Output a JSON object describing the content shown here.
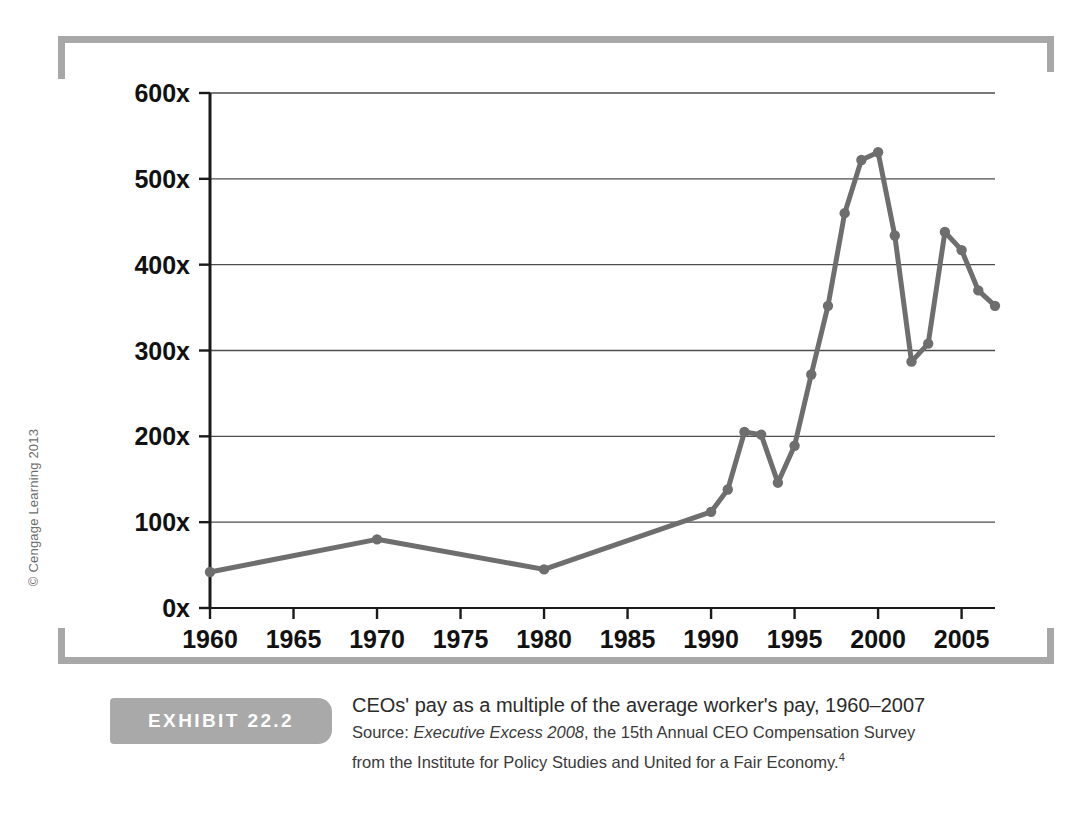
{
  "exhibit": {
    "tab_label": "EXHIBIT 22.2",
    "title": "CEOs' pay as a multiple of the average worker's pay, 1960–2007",
    "source_prefix": "Source: ",
    "source_italic": "Executive Excess 2008",
    "source_rest": ", the 15th Annual CEO Compensation Survey",
    "source_line2": "from the Institute for Policy Studies and United for a Fair Economy.",
    "footnote_marker": "4"
  },
  "copyright": "© Cengage Learning 2013",
  "colors": {
    "line": "#6e6e6e",
    "marker": "#6e6e6e",
    "axis": "#1a1a1a",
    "grid": "#4d4d4d",
    "bracket": "#a8a8a8",
    "tab": "#a9a9a9"
  },
  "chart_data": {
    "type": "line",
    "title": "CEOs' pay as a multiple of the average worker's pay, 1960–2007",
    "xlabel": "",
    "ylabel": "",
    "xlim": [
      1960,
      2007
    ],
    "ylim": [
      0,
      600
    ],
    "ytick_labels": [
      "0x",
      "100x",
      "200x",
      "300x",
      "400x",
      "500x",
      "600x"
    ],
    "ytick_values": [
      0,
      100,
      200,
      300,
      400,
      500,
      600
    ],
    "xtick_labels": [
      "1960",
      "1965",
      "1970",
      "1975",
      "1980",
      "1985",
      "1990",
      "1995",
      "2000",
      "2005"
    ],
    "xtick_values": [
      1960,
      1965,
      1970,
      1975,
      1980,
      1985,
      1990,
      1995,
      2000,
      2005
    ],
    "grid": "horizontal",
    "legend": "none",
    "markers": true,
    "series": [
      {
        "name": "CEO pay multiple",
        "x": [
          1960,
          1970,
          1980,
          1990,
          1991,
          1992,
          1993,
          1994,
          1995,
          1996,
          1997,
          1998,
          1999,
          2000,
          2001,
          2002,
          2003,
          2004,
          2005,
          2006,
          2007
        ],
        "values": [
          42,
          80,
          45,
          112,
          138,
          205,
          202,
          146,
          189,
          272,
          352,
          460,
          522,
          531,
          434,
          287,
          308,
          438,
          417,
          370,
          352
        ]
      }
    ]
  }
}
